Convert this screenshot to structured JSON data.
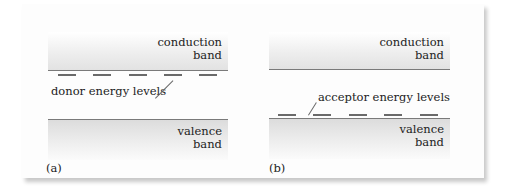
{
  "figure": {
    "panels": [
      {
        "id": "a",
        "label": "(a)",
        "conduction_band": {
          "line1": "conduction",
          "line2": "band"
        },
        "valence_band": {
          "line1": "valence",
          "line2": "band"
        },
        "annotation": "donor energy levels",
        "impurity_level_position": "just below conduction band",
        "dash_count": 5
      },
      {
        "id": "b",
        "label": "(b)",
        "conduction_band": {
          "line1": "conduction",
          "line2": "band"
        },
        "valence_band": {
          "line1": "valence",
          "line2": "band"
        },
        "annotation": "acceptor energy levels",
        "impurity_level_position": "just above valence band",
        "dash_count": 5
      }
    ],
    "colors": {
      "band_edge": "#7a7a7a",
      "band_fill": "#e6e6e6",
      "dash": "#6a6a6a"
    }
  }
}
